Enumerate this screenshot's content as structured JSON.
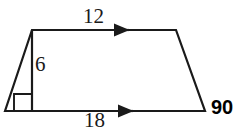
{
  "figure": {
    "kind": "trapezoid-with-height-diagram",
    "background_color": "#ffffff",
    "stroke_color": "#1a1a1a",
    "labels": {
      "top_side": "12",
      "height": "6",
      "bottom_side": "18",
      "angle": "90"
    },
    "marks": {
      "right_angle_square": "right-angle-mark",
      "top_arrow": "parallel-arrow-single",
      "bottom_arrow": "parallel-arrow-single"
    },
    "vertices": {
      "bottom_left": [
        5,
        111
      ],
      "top_left": [
        32,
        30
      ],
      "top_right": [
        176,
        30
      ],
      "bottom_right": [
        205,
        111
      ]
    },
    "height_segment": [
      [
        32,
        30
      ],
      [
        32,
        111
      ]
    ]
  }
}
